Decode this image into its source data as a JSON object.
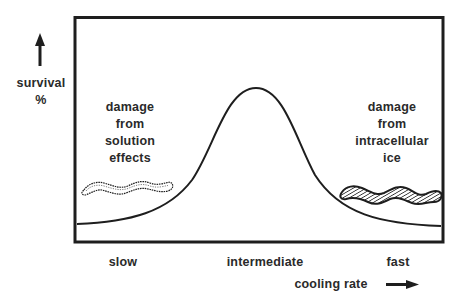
{
  "diagram": {
    "type": "conceptual-curve",
    "y_axis": {
      "label_line1": "survival",
      "label_line2": "%",
      "arrow": "up-arrow-icon"
    },
    "x_axis": {
      "label": "cooling rate",
      "arrow": "right-arrow-icon",
      "ticks": [
        "slow",
        "intermediate",
        "fast"
      ]
    },
    "annotations": {
      "left": {
        "line1": "damage",
        "line2": "from",
        "line3": "solution",
        "line4": "effects",
        "symbol": "outlined wavy band (solution effects)"
      },
      "right": {
        "line1": "damage",
        "line2": "from",
        "line3": "intracellular",
        "line4": "ice",
        "symbol": "hatched wavy band (intracellular ice)"
      }
    },
    "curve": {
      "shape": "bell / inverted-U",
      "description": "Survival is low at slow and fast cooling rates and peaks at an intermediate cooling rate"
    },
    "colors": {
      "ink": "#1e1e1e",
      "background": "#ffffff"
    }
  }
}
